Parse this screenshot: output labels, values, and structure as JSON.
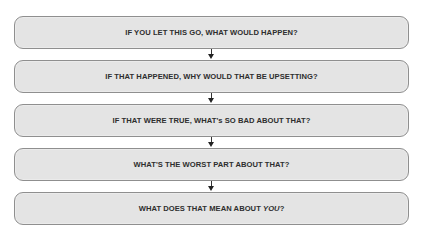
{
  "diagram": {
    "type": "vertical-flowchart",
    "colors": {
      "box_fill": "#e4e4e4",
      "box_border": "#8f8f8f",
      "text": "#2e2e2e",
      "arrow": "#222222"
    },
    "steps": [
      {
        "label": "IF YOU LET THIS GO, WHAT WOULD HAPPEN?",
        "label_suffix": ""
      },
      {
        "label": "IF THAT HAPPENED, WHY WOULD THAT BE UPSETTING?",
        "label_suffix": ""
      },
      {
        "label": "IF THAT WERE TRUE, WHAT's SO BAD ABOUT THAT?",
        "label_suffix": ""
      },
      {
        "label": "WHAT'S THE WORST PART ABOUT THAT?",
        "label_suffix": ""
      },
      {
        "label": "WHAT DOES THAT MEAN ABOUT ",
        "label_emphasis": "YOU",
        "label_suffix": "?"
      }
    ],
    "connectors": [
      {
        "from": 0,
        "to": 1,
        "icon": "arrow-down-icon"
      },
      {
        "from": 1,
        "to": 2,
        "icon": "arrow-down-icon"
      },
      {
        "from": 2,
        "to": 3,
        "icon": "arrow-down-icon"
      },
      {
        "from": 3,
        "to": 4,
        "icon": "arrow-down-icon"
      }
    ]
  }
}
